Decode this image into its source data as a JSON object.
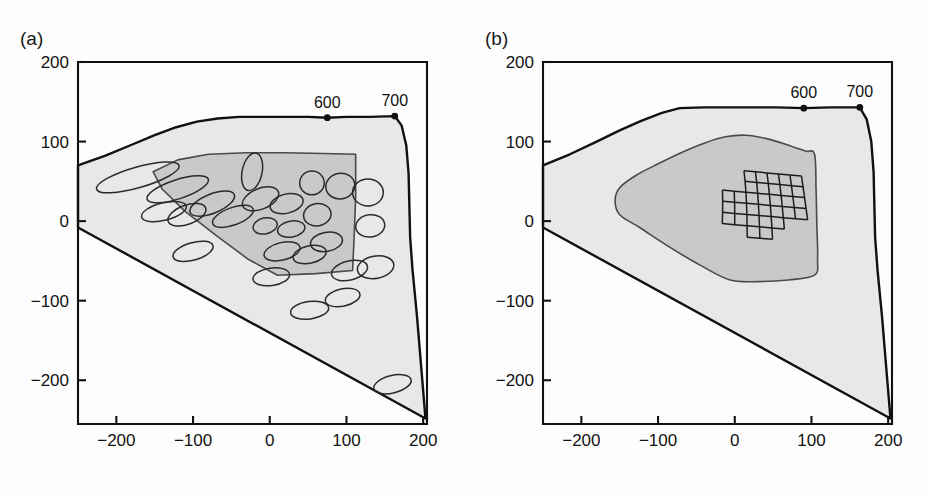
{
  "figure": {
    "type": "scientific-figure",
    "width": 930,
    "height": 496,
    "background_color": "#fdfdfd"
  },
  "colors": {
    "outer_gamut_fill": "#e8e8e8",
    "inner_gamut_fill": "#c9c9c9",
    "line": "#111111",
    "ellipse_stroke": "#2b2b2b",
    "mesh_stroke": "#1c1c1c"
  },
  "panels": [
    {
      "id": "a",
      "tag": "(a)",
      "xlabel": {
        "base": "a",
        "sup": "*",
        "sub": ""
      },
      "ylabel": {
        "base": "b",
        "sup": "*",
        "sub": ""
      },
      "overlay": "ellipses",
      "wavelength_markers": [
        {
          "label": "600",
          "a": 75,
          "b": 130
        },
        {
          "label": "700",
          "a": 163,
          "b": 132
        }
      ]
    },
    {
      "id": "b",
      "tag": "(b)",
      "xlabel": {
        "base": "a",
        "sup": "*",
        "sub": "10"
      },
      "ylabel": {
        "base": "b",
        "sup": "*",
        "sub": "10"
      },
      "overlay": "grid-mesh",
      "wavelength_markers": [
        {
          "label": "600",
          "a": 90,
          "b": 142
        },
        {
          "label": "700",
          "a": 163,
          "b": 143
        }
      ]
    }
  ],
  "axes": {
    "x": {
      "min": -250,
      "max": 205,
      "ticks": [
        -200,
        -100,
        0,
        100,
        200
      ],
      "tick_labels": [
        "-200",
        "-100",
        "0",
        "100",
        "200"
      ]
    },
    "y": {
      "min": -255,
      "max": 200,
      "ticks": [
        200,
        100,
        0,
        -100,
        -200
      ],
      "tick_labels": [
        "200",
        "100",
        "0",
        "-100",
        "-200"
      ]
    }
  },
  "chart_data": {
    "type": "scatter",
    "title": "",
    "xlabel": "a*",
    "ylabel": "b*",
    "xlim": [
      -250,
      205
    ],
    "ylim": [
      -255,
      200
    ],
    "grid": false,
    "legend": "none",
    "panel_a": {
      "outer_gamut_boundary": [
        [
          -250,
          70
        ],
        [
          -215,
          82
        ],
        [
          -180,
          96
        ],
        [
          -150,
          108
        ],
        [
          -122,
          118
        ],
        [
          -95,
          125
        ],
        [
          -68,
          129
        ],
        [
          -40,
          131
        ],
        [
          -10,
          131
        ],
        [
          20,
          131
        ],
        [
          50,
          131
        ],
        [
          75,
          130
        ],
        [
          100,
          131
        ],
        [
          130,
          131
        ],
        [
          163,
          132
        ],
        [
          172,
          120
        ],
        [
          178,
          95
        ],
        [
          181,
          60
        ],
        [
          182,
          20
        ],
        [
          183,
          -20
        ],
        [
          186,
          -60
        ],
        [
          192,
          -120
        ],
        [
          198,
          -190
        ],
        [
          203,
          -248
        ],
        [
          -250,
          -8
        ]
      ],
      "inner_gamut_boundary": [
        [
          -152,
          62
        ],
        [
          -120,
          77
        ],
        [
          -80,
          84
        ],
        [
          -30,
          86
        ],
        [
          20,
          86
        ],
        [
          70,
          85
        ],
        [
          112,
          84
        ],
        [
          112,
          30
        ],
        [
          110,
          -20
        ],
        [
          108,
          -62
        ],
        [
          60,
          -66
        ],
        [
          10,
          -68
        ],
        [
          -28,
          -48
        ],
        [
          -70,
          -18
        ],
        [
          -110,
          12
        ],
        [
          -140,
          40
        ]
      ],
      "ellipses": [
        {
          "cx": -172,
          "cy": 55,
          "rx": 56,
          "ry": 13,
          "angle": -16
        },
        {
          "cx": -120,
          "cy": 40,
          "rx": 42,
          "ry": 12,
          "angle": -18
        },
        {
          "cx": -138,
          "cy": 12,
          "rx": 30,
          "ry": 11,
          "angle": -14
        },
        {
          "cx": -108,
          "cy": 8,
          "rx": 26,
          "ry": 12,
          "angle": -20
        },
        {
          "cx": -75,
          "cy": 22,
          "rx": 31,
          "ry": 12,
          "angle": -22
        },
        {
          "cx": -48,
          "cy": 6,
          "rx": 28,
          "ry": 11,
          "angle": -20
        },
        {
          "cx": -100,
          "cy": -38,
          "rx": 27,
          "ry": 11,
          "angle": -16
        },
        {
          "cx": -23,
          "cy": 62,
          "rx": 13,
          "ry": 24,
          "angle": 12
        },
        {
          "cx": -12,
          "cy": 28,
          "rx": 25,
          "ry": 13,
          "angle": -22
        },
        {
          "cx": -6,
          "cy": -6,
          "rx": 16,
          "ry": 10,
          "angle": -12
        },
        {
          "cx": 22,
          "cy": 22,
          "rx": 22,
          "ry": 12,
          "angle": -14
        },
        {
          "cx": 28,
          "cy": -10,
          "rx": 18,
          "ry": 10,
          "angle": -10
        },
        {
          "cx": 16,
          "cy": -38,
          "rx": 24,
          "ry": 11,
          "angle": -14
        },
        {
          "cx": 52,
          "cy": -42,
          "rx": 22,
          "ry": 11,
          "angle": -12
        },
        {
          "cx": 55,
          "cy": 48,
          "rx": 16,
          "ry": 15,
          "angle": 0
        },
        {
          "cx": 62,
          "cy": 8,
          "rx": 18,
          "ry": 14,
          "angle": -10
        },
        {
          "cx": 74,
          "cy": -26,
          "rx": 21,
          "ry": 12,
          "angle": -10
        },
        {
          "cx": 92,
          "cy": 44,
          "rx": 19,
          "ry": 16,
          "angle": -10
        },
        {
          "cx": 104,
          "cy": -62,
          "rx": 24,
          "ry": 12,
          "angle": -14
        },
        {
          "cx": 128,
          "cy": 36,
          "rx": 20,
          "ry": 17,
          "angle": 0
        },
        {
          "cx": 131,
          "cy": -6,
          "rx": 19,
          "ry": 14,
          "angle": -8
        },
        {
          "cx": 138,
          "cy": -58,
          "rx": 24,
          "ry": 14,
          "angle": -10
        },
        {
          "cx": 2,
          "cy": -70,
          "rx": 24,
          "ry": 11,
          "angle": -8
        },
        {
          "cx": 95,
          "cy": -96,
          "rx": 23,
          "ry": 11,
          "angle": -12
        },
        {
          "cx": 52,
          "cy": -112,
          "rx": 25,
          "ry": 11,
          "angle": -8
        },
        {
          "cx": 160,
          "cy": -205,
          "rx": 25,
          "ry": 11,
          "angle": -14
        }
      ]
    },
    "panel_b": {
      "outer_gamut_boundary": [
        [
          -250,
          70
        ],
        [
          -215,
          84
        ],
        [
          -180,
          100
        ],
        [
          -150,
          114
        ],
        [
          -122,
          126
        ],
        [
          -95,
          136
        ],
        [
          -72,
          142
        ],
        [
          -40,
          143
        ],
        [
          -10,
          143
        ],
        [
          20,
          143
        ],
        [
          55,
          143
        ],
        [
          90,
          142
        ],
        [
          125,
          143
        ],
        [
          163,
          143
        ],
        [
          172,
          128
        ],
        [
          178,
          100
        ],
        [
          181,
          62
        ],
        [
          182,
          20
        ],
        [
          183,
          -20
        ],
        [
          186,
          -60
        ],
        [
          192,
          -120
        ],
        [
          198,
          -190
        ],
        [
          203,
          -248
        ],
        [
          -250,
          -8
        ]
      ],
      "inner_gamut_boundary": [
        [
          -156,
          26
        ],
        [
          -150,
          42
        ],
        [
          -128,
          58
        ],
        [
          -100,
          72
        ],
        [
          -70,
          86
        ],
        [
          -40,
          98
        ],
        [
          -12,
          106
        ],
        [
          14,
          108
        ],
        [
          40,
          104
        ],
        [
          68,
          96
        ],
        [
          92,
          88
        ],
        [
          104,
          84
        ],
        [
          106,
          40
        ],
        [
          107,
          -4
        ],
        [
          108,
          -48
        ],
        [
          104,
          -68
        ],
        [
          70,
          -74
        ],
        [
          30,
          -76
        ],
        [
          -6,
          -74
        ],
        [
          -44,
          -56
        ],
        [
          -86,
          -32
        ],
        [
          -124,
          -8
        ],
        [
          -150,
          8
        ]
      ],
      "grid_mesh": {
        "rows": 6,
        "cols": 7,
        "x_origin": -18,
        "y_origin": 66,
        "cell_w": 15,
        "cell_h": 13,
        "shear_x": 2.0,
        "shear_y": -3.2,
        "notch_rows": [
          4,
          5
        ],
        "notch_cols": [
          0,
          1,
          5,
          6
        ]
      }
    }
  }
}
